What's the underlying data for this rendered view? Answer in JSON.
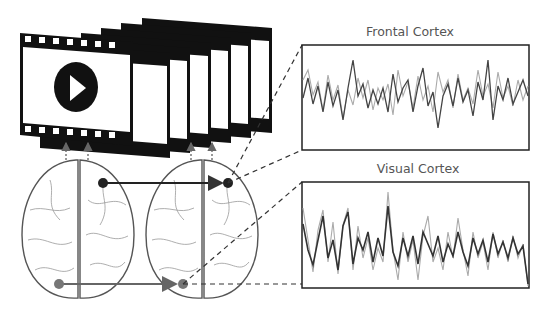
{
  "diagram": {
    "panels": {
      "frontal": {
        "title": "Frontal Cortex",
        "box": [
          302,
          45,
          227,
          105
        ]
      },
      "visual": {
        "title": "Visual Cortex",
        "box": [
          302,
          182,
          227,
          106
        ]
      }
    },
    "elements": {
      "film_frames": {
        "count": 7,
        "icon": "play-button-icon"
      },
      "brains": {
        "count": 2,
        "view": "top-down"
      },
      "upward_arrows": 4,
      "nodes": [
        {
          "name": "frontal-node-left",
          "color": "#222222"
        },
        {
          "name": "frontal-node-right",
          "color": "#222222"
        },
        {
          "name": "visual-node-left",
          "color": "#777777"
        },
        {
          "name": "visual-node-right",
          "color": "#777777"
        }
      ]
    },
    "colors": {
      "dark_signal": "#444444",
      "light_signal": "#aaaaaa",
      "frame": "#111111",
      "brain_outline": "#555555",
      "vessels": "#999999"
    }
  }
}
